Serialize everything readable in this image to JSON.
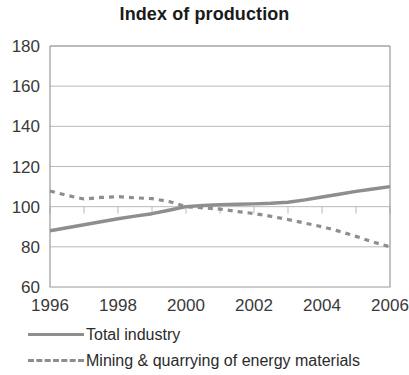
{
  "chart_data": {
    "type": "line",
    "title": "Index of production",
    "xlabel": "",
    "ylabel": "",
    "xlim": [
      1996,
      2006
    ],
    "ylim": [
      60,
      180
    ],
    "yticks": [
      60,
      80,
      100,
      120,
      140,
      160,
      180
    ],
    "xticks": [
      1996,
      1997,
      1998,
      1999,
      2000,
      2001,
      2002,
      2003,
      2004,
      2005,
      2006
    ],
    "xtick_labels": [
      "1996",
      "1998",
      "2000",
      "2002",
      "2004",
      "2006"
    ],
    "xtick_label_values": [
      1996,
      1998,
      2000,
      2002,
      2004,
      2006
    ],
    "grid": true,
    "grid_axis": "y",
    "legend_position": "bottom-left",
    "x": [
      1996,
      1996.5,
      1997,
      1997.5,
      1998,
      1998.5,
      1999,
      1999.5,
      2000,
      2000.5,
      2001,
      2001.5,
      2002,
      2002.5,
      2003,
      2003.5,
      2004,
      2004.5,
      2005,
      2005.5,
      2006
    ],
    "series": [
      {
        "name": "Total industry",
        "style": "solid",
        "color": "#8e8e8e",
        "values": [
          88.0,
          89.5,
          91.0,
          92.5,
          94.0,
          95.3,
          96.5,
          98.2,
          100.0,
          100.6,
          101.0,
          101.2,
          101.4,
          101.7,
          102.2,
          103.4,
          104.8,
          106.2,
          107.6,
          108.8,
          110.0
        ]
      },
      {
        "name": "Mining & quarrying of energy materials",
        "style": "dashed",
        "color": "#8e8e8e",
        "values": [
          107.8,
          105.6,
          103.8,
          104.6,
          105.0,
          104.4,
          104.0,
          102.6,
          100.0,
          99.4,
          98.8,
          97.6,
          96.6,
          95.2,
          93.6,
          91.8,
          90.0,
          87.8,
          85.2,
          82.4,
          80.0
        ]
      }
    ]
  },
  "legend": {
    "items": [
      {
        "label": "Total industry",
        "style": "solid"
      },
      {
        "label": "Mining & quarrying of energy materials",
        "style": "dashed"
      }
    ]
  },
  "axis_colors": {
    "grid": "#b9b9b9",
    "frame": "#9a9a9a",
    "line": "#8e8e8e",
    "text": "#2b2b2b"
  }
}
